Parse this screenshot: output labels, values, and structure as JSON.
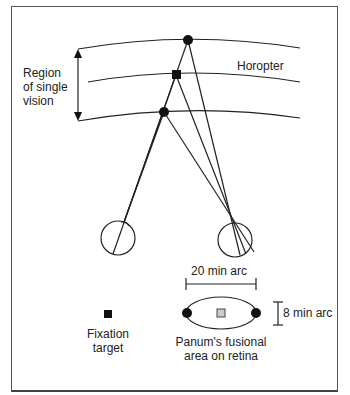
{
  "labels": {
    "region_line1": "Region",
    "region_line2": "of single",
    "region_line3": "vision",
    "horopter": "Horopter",
    "width_arc": "20 min arc",
    "height_arc": "8 min arc",
    "fixation_line1": "Fixation",
    "fixation_line2": "target",
    "panum_line1": "Panum's fusional",
    "panum_line2": "area on retina"
  },
  "colors": {
    "line": "#222222",
    "fill_dark": "#111111",
    "fill_gray": "#cccccc"
  },
  "diagram": {
    "arcs": [
      "outer boundary (far)",
      "horopter",
      "inner boundary (near)"
    ],
    "points": [
      {
        "name": "far-point",
        "shape": "circle"
      },
      {
        "name": "fixation-point",
        "shape": "square"
      },
      {
        "name": "near-point",
        "shape": "circle"
      }
    ],
    "eyes": [
      "left-eye",
      "right-eye"
    ]
  }
}
